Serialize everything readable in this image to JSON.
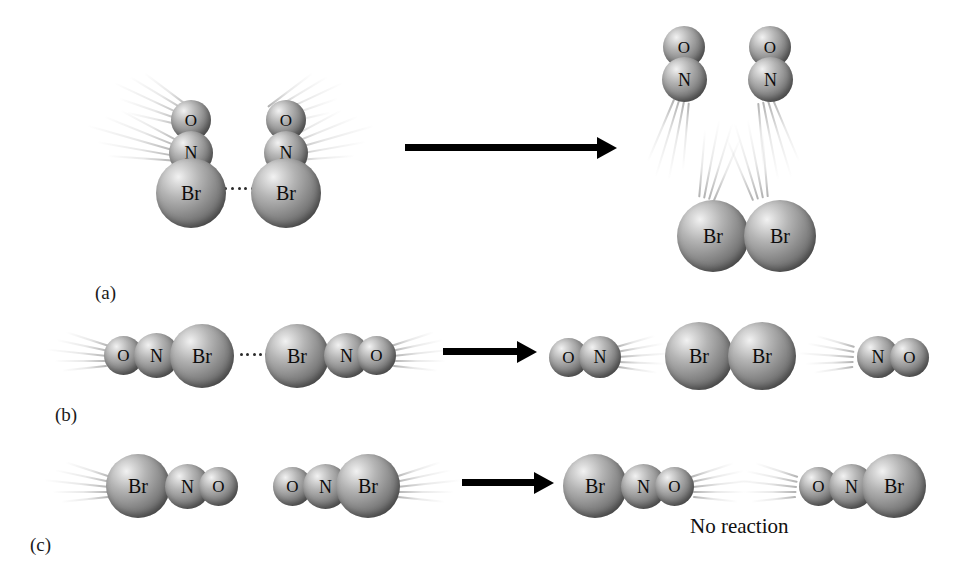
{
  "figure": {
    "background_color": "#ffffff",
    "atom_colors": {
      "sphere_highlight": "#f2f2f2",
      "sphere_mid": "#8f8f8f",
      "sphere_shadow": "#4a4a4a",
      "label_color": "#0d0d0d",
      "arrow_color": "#000000",
      "trail_color": "#c9c9c9",
      "dot_color": "#2a2a2a"
    },
    "notes": {
      "no_reaction": "No reaction"
    },
    "panels": [
      {
        "id": "a",
        "label": "(a)",
        "label_x": 95,
        "label_y": 282,
        "arrow": {
          "x": 405,
          "y": 144,
          "shaft_width": 196,
          "head_left": 192
        },
        "atoms": [
          {
            "name": "reactant-left-o",
            "text": "O",
            "x": 171,
            "y": 100,
            "size": 40,
            "cls": "small"
          },
          {
            "name": "reactant-left-n",
            "text": "N",
            "x": 169,
            "y": 131,
            "size": 44,
            "cls": "medium"
          },
          {
            "name": "reactant-left-br",
            "text": "Br",
            "x": 156,
            "y": 158,
            "size": 70,
            "cls": "large"
          },
          {
            "name": "reactant-right-o",
            "text": "O",
            "x": 266,
            "y": 100,
            "size": 40,
            "cls": "small"
          },
          {
            "name": "reactant-right-n",
            "text": "N",
            "x": 264,
            "y": 131,
            "size": 44,
            "cls": "medium"
          },
          {
            "name": "reactant-right-br",
            "text": "Br",
            "x": 251,
            "y": 158,
            "size": 70,
            "cls": "large"
          },
          {
            "name": "product-no1-o",
            "text": "O",
            "x": 663,
            "y": 26,
            "size": 42,
            "cls": "small"
          },
          {
            "name": "product-no1-n",
            "text": "N",
            "x": 662,
            "y": 57,
            "size": 45,
            "cls": "medium"
          },
          {
            "name": "product-no2-o",
            "text": "O",
            "x": 749,
            "y": 26,
            "size": 42,
            "cls": "small"
          },
          {
            "name": "product-no2-n",
            "text": "N",
            "x": 748,
            "y": 57,
            "size": 45,
            "cls": "medium"
          },
          {
            "name": "product-br2-left",
            "text": "Br",
            "x": 677,
            "y": 200,
            "size": 72,
            "cls": "large"
          },
          {
            "name": "product-br2-right",
            "text": "Br",
            "x": 744,
            "y": 200,
            "size": 72,
            "cls": "large"
          }
        ],
        "dots": {
          "x": 224,
          "y": 186,
          "width": 30
        },
        "trails": [
          {
            "x": 185,
            "y": 115,
            "angle": 205,
            "count": 5,
            "length": 78
          },
          {
            "x": 176,
            "y": 150,
            "angle": 196,
            "count": 5,
            "length": 92
          },
          {
            "x": 272,
            "y": 115,
            "angle": 335,
            "count": 5,
            "length": 78
          },
          {
            "x": 286,
            "y": 150,
            "angle": 344,
            "count": 5,
            "length": 92
          },
          {
            "x": 682,
            "y": 100,
            "angle": 104,
            "count": 4,
            "length": 86
          },
          {
            "x": 766,
            "y": 100,
            "angle": 76,
            "count": 4,
            "length": 86
          },
          {
            "x": 706,
            "y": 198,
            "angle": 284,
            "count": 4,
            "length": 86
          },
          {
            "x": 760,
            "y": 198,
            "angle": 256,
            "count": 4,
            "length": 86
          }
        ]
      },
      {
        "id": "b",
        "label": "(b)",
        "label_x": 55,
        "label_y": 404,
        "arrow": {
          "x": 443,
          "y": 348,
          "shaft_width": 78,
          "head_left": 74
        },
        "atoms": [
          {
            "name": "reactant-left-o",
            "text": "O",
            "x": 104,
            "y": 336,
            "size": 39,
            "cls": "small"
          },
          {
            "name": "reactant-left-n",
            "text": "N",
            "x": 134,
            "y": 333,
            "size": 45,
            "cls": "medium"
          },
          {
            "name": "reactant-left-br",
            "text": "Br",
            "x": 170,
            "y": 324,
            "size": 64,
            "cls": "large"
          },
          {
            "name": "reactant-right-br",
            "text": "Br",
            "x": 265,
            "y": 324,
            "size": 64,
            "cls": "large"
          },
          {
            "name": "reactant-right-n",
            "text": "N",
            "x": 324,
            "y": 333,
            "size": 45,
            "cls": "medium"
          },
          {
            "name": "reactant-right-o",
            "text": "O",
            "x": 357,
            "y": 336,
            "size": 39,
            "cls": "small"
          },
          {
            "name": "product-no-left-o",
            "text": "O",
            "x": 549,
            "y": 338,
            "size": 39,
            "cls": "small"
          },
          {
            "name": "product-no-left-n",
            "text": "N",
            "x": 579,
            "y": 336,
            "size": 42,
            "cls": "medium"
          },
          {
            "name": "product-br2-left",
            "text": "Br",
            "x": 665,
            "y": 322,
            "size": 68,
            "cls": "large"
          },
          {
            "name": "product-br2-right",
            "text": "Br",
            "x": 728,
            "y": 322,
            "size": 68,
            "cls": "large"
          },
          {
            "name": "product-no-right-n",
            "text": "N",
            "x": 857,
            "y": 336,
            "size": 42,
            "cls": "medium"
          },
          {
            "name": "product-no-right-o",
            "text": "O",
            "x": 890,
            "y": 338,
            "size": 39,
            "cls": "small"
          }
        ],
        "dots": {
          "x": 240,
          "y": 352,
          "width": 28
        },
        "trails": [
          {
            "x": 108,
            "y": 355,
            "angle": 186,
            "count": 5,
            "length": 62
          },
          {
            "x": 392,
            "y": 355,
            "angle": 354,
            "count": 5,
            "length": 62
          },
          {
            "x": 617,
            "y": 356,
            "angle": 356,
            "count": 5,
            "length": 56
          },
          {
            "x": 854,
            "y": 356,
            "angle": 184,
            "count": 5,
            "length": 56
          }
        ]
      },
      {
        "id": "c",
        "label": "(c)",
        "label_x": 30,
        "label_y": 534,
        "arrow": {
          "x": 462,
          "y": 479,
          "shaft_width": 76,
          "head_left": 72
        },
        "atoms": [
          {
            "name": "reactant-left-br",
            "text": "Br",
            "x": 106,
            "y": 454,
            "size": 64,
            "cls": "large"
          },
          {
            "name": "reactant-left-n",
            "text": "N",
            "x": 165,
            "y": 464,
            "size": 45,
            "cls": "medium"
          },
          {
            "name": "reactant-left-o",
            "text": "O",
            "x": 199,
            "y": 467,
            "size": 39,
            "cls": "small"
          },
          {
            "name": "reactant-right-o",
            "text": "O",
            "x": 273,
            "y": 467,
            "size": 39,
            "cls": "small"
          },
          {
            "name": "reactant-right-n",
            "text": "N",
            "x": 303,
            "y": 464,
            "size": 45,
            "cls": "medium"
          },
          {
            "name": "reactant-right-br",
            "text": "Br",
            "x": 336,
            "y": 454,
            "size": 64,
            "cls": "large"
          },
          {
            "name": "product-left-br",
            "text": "Br",
            "x": 563,
            "y": 454,
            "size": 64,
            "cls": "large"
          },
          {
            "name": "product-left-n",
            "text": "N",
            "x": 621,
            "y": 464,
            "size": 45,
            "cls": "medium"
          },
          {
            "name": "product-left-o",
            "text": "O",
            "x": 655,
            "y": 467,
            "size": 39,
            "cls": "small"
          },
          {
            "name": "product-right-o",
            "text": "O",
            "x": 799,
            "y": 467,
            "size": 39,
            "cls": "small"
          },
          {
            "name": "product-right-n",
            "text": "N",
            "x": 829,
            "y": 464,
            "size": 45,
            "cls": "medium"
          },
          {
            "name": "product-right-br",
            "text": "Br",
            "x": 862,
            "y": 454,
            "size": 64,
            "cls": "large"
          }
        ],
        "dots": null,
        "trails": [
          {
            "x": 110,
            "y": 486,
            "angle": 186,
            "count": 5,
            "length": 66
          },
          {
            "x": 396,
            "y": 486,
            "angle": 354,
            "count": 5,
            "length": 66
          },
          {
            "x": 692,
            "y": 486,
            "angle": 354,
            "count": 5,
            "length": 62
          },
          {
            "x": 797,
            "y": 486,
            "angle": 186,
            "count": 5,
            "length": 62
          }
        ],
        "note": {
          "text": "No reaction",
          "x": 690,
          "y": 514
        }
      }
    ]
  }
}
